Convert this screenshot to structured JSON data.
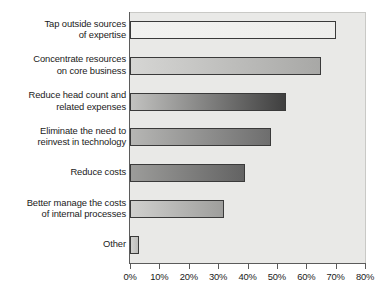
{
  "chart_data": {
    "type": "bar",
    "orientation": "horizontal",
    "title": "",
    "subtitle": "",
    "xlabel": "",
    "ylabel": "",
    "xlim": [
      0,
      80
    ],
    "xtick_step": 10,
    "grid": false,
    "legend": null,
    "value_unit": "%",
    "categories": [
      "Tap outside sources of expertise",
      "Concentrate resources on core business",
      "Reduce head count and related expenses",
      "Eliminate the need to reinvest in technology",
      "Reduce costs",
      "Better manage the costs of internal processes",
      "Other"
    ],
    "category_lines": [
      [
        "Tap outside sources",
        "of expertise"
      ],
      [
        "Concentrate resources",
        "on core business"
      ],
      [
        "Reduce head count and",
        "related expenses"
      ],
      [
        "Eliminate the need to",
        "reinvest in technology"
      ],
      [
        "Reduce costs",
        ""
      ],
      [
        "Better manage the costs",
        "of internal processes"
      ],
      [
        "Other",
        ""
      ]
    ],
    "values": [
      70,
      65,
      53,
      48,
      39,
      32,
      3
    ],
    "xticks": [
      0,
      10,
      20,
      30,
      40,
      50,
      60,
      70,
      80
    ],
    "xtick_labels": [
      "0%",
      "10%",
      "20%",
      "30%",
      "40%",
      "50%",
      "60%",
      "70%",
      "80%"
    ],
    "bar_fill_left": [
      "#f2f2f0",
      "#d6d6d4",
      "#c2c2c0",
      "#b6b6b4",
      "#9c9c9a",
      "#d0d0ce",
      "#d2d2d0"
    ],
    "bar_fill_right": [
      "#eeeeec",
      "#a8a8a6",
      "#3f3f3f",
      "#6e6e6e",
      "#636363",
      "#9e9e9c",
      "#bdbdbb"
    ],
    "bar_border_color": "#3a3a3a",
    "plot_background": "#e9e9e7",
    "page_background": "#ffffff",
    "axis_color": "#5b5b5b",
    "text_color": "#1a1a1a"
  }
}
